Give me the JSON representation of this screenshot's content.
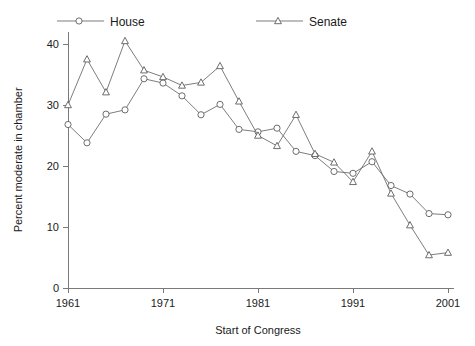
{
  "chart_data": {
    "type": "line",
    "title": "",
    "xlabel": "Start of Congress",
    "ylabel": "Percent moderate in chamber",
    "xlim": [
      1960,
      2002
    ],
    "ylim": [
      0,
      42
    ],
    "xticks": [
      1961,
      1971,
      1981,
      1991,
      2001
    ],
    "yticks": [
      0,
      10,
      20,
      30,
      40
    ],
    "xtick_labels": [
      "1961",
      "1971",
      "1981",
      "1991",
      "2001"
    ],
    "ytick_labels": [
      "0",
      "10",
      "20",
      "30",
      "40"
    ],
    "grid": false,
    "legend_position": "top",
    "x": [
      1961,
      1963,
      1965,
      1967,
      1969,
      1971,
      1973,
      1975,
      1977,
      1979,
      1981,
      1983,
      1985,
      1987,
      1989,
      1991,
      1993,
      1995,
      1997,
      1999,
      2001
    ],
    "series": [
      {
        "name": "House",
        "marker": "circle",
        "color": "#5d5d5d",
        "values": [
          26.8,
          23.8,
          28.5,
          29.2,
          34.3,
          33.6,
          31.5,
          28.4,
          30.1,
          26.0,
          25.6,
          26.2,
          22.4,
          21.7,
          19.1,
          18.8,
          20.7,
          16.8,
          15.4,
          12.2,
          12.0
        ]
      },
      {
        "name": "Senate",
        "marker": "triangle",
        "color": "#5d5d5d",
        "values": [
          30.0,
          37.5,
          32.1,
          40.5,
          35.7,
          34.6,
          33.2,
          33.7,
          36.4,
          30.6,
          25.0,
          23.3,
          28.4,
          22.0,
          20.6,
          17.4,
          22.4,
          15.5,
          10.3,
          5.4,
          5.8
        ]
      }
    ]
  },
  "legend": {
    "entries": [
      {
        "label": "House",
        "marker": "circle"
      },
      {
        "label": "Senate",
        "marker": "triangle"
      }
    ]
  },
  "axes": {
    "x_title": "Start of Congress",
    "y_title": "Percent moderate in chamber"
  }
}
